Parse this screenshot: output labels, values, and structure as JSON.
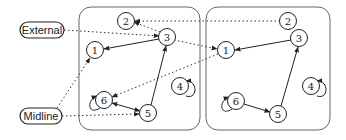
{
  "labels": {
    "external": "External",
    "midline": "Midline"
  },
  "panels": [
    {
      "name": "left",
      "nodes": [
        {
          "id": "1",
          "label": "1",
          "x": 95,
          "y": 50
        },
        {
          "id": "2",
          "label": "2",
          "x": 126,
          "y": 21
        },
        {
          "id": "3",
          "label": "3",
          "x": 167,
          "y": 37
        },
        {
          "id": "4",
          "label": "4",
          "x": 180,
          "y": 86
        },
        {
          "id": "5",
          "label": "5",
          "x": 148,
          "y": 113
        },
        {
          "id": "6",
          "label": "6",
          "x": 104,
          "y": 100
        }
      ]
    },
    {
      "name": "right",
      "nodes": [
        {
          "id": "1",
          "label": "1",
          "x": 226,
          "y": 50
        },
        {
          "id": "2",
          "label": "2",
          "x": 288,
          "y": 21
        },
        {
          "id": "3",
          "label": "3",
          "x": 299,
          "y": 38
        },
        {
          "id": "4",
          "label": "4",
          "x": 311,
          "y": 86
        },
        {
          "id": "5",
          "label": "5",
          "x": 278,
          "y": 114
        },
        {
          "id": "6",
          "label": "6",
          "x": 236,
          "y": 101
        }
      ]
    }
  ],
  "edges": {
    "solid": [
      "left 3 -> left 1",
      "left 5 -> left 3",
      "left 6 <-> left 5",
      "right 3 -> right 1",
      "right 5 -> right 3",
      "right 6 -> right 5"
    ],
    "dotted": [
      "External -> left 3",
      "Midline -> left 1",
      "Midline -> left 5",
      "left 3 -> left 2",
      "right 2 -> left 2",
      "left 3 -> right 1",
      "right 1 -> left 6"
    ],
    "self_loops": [
      "left 4",
      "left 6",
      "right 4",
      "right 6"
    ]
  }
}
